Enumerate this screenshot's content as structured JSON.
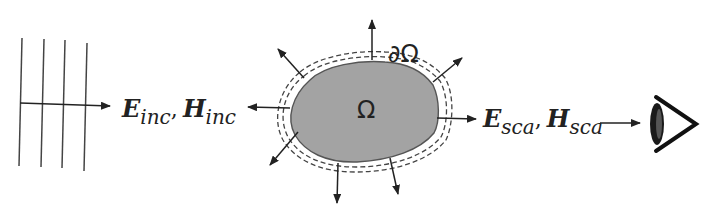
{
  "diagram": {
    "type": "scattering-schematic",
    "incident_wave": {
      "label_E": "E",
      "label_E_sub": "inc",
      "separator": ",",
      "label_H": "H",
      "label_H_sub": "inc",
      "wavefront_count": 4
    },
    "scatterer": {
      "domain_label": "Ω",
      "boundary_label": "∂Ω",
      "fill_color": "#a3a3a3",
      "outward_arrow_count": 8
    },
    "scattered_wave": {
      "label_E": "E",
      "label_E_sub": "sca",
      "separator": ",",
      "label_H": "H",
      "label_H_sub": "sca"
    },
    "observer": {
      "icon": "eye-icon"
    },
    "colors": {
      "stroke": "#333333",
      "background": "#ffffff",
      "scatterer_fill": "#a3a3a3"
    }
  }
}
